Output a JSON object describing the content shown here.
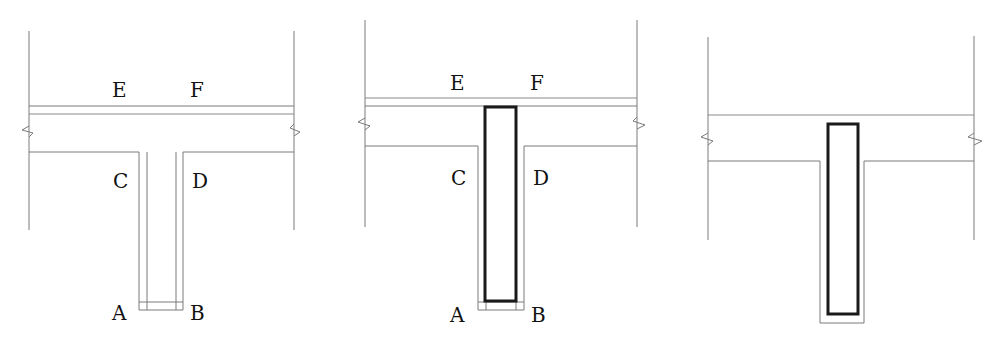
{
  "figure": {
    "panels": [
      {
        "id": "panel-1",
        "description": "T-beam section, original",
        "labels": {
          "E": "E",
          "F": "F",
          "C": "C",
          "D": "D",
          "A": "A",
          "B": "B"
        },
        "reinforcement": false
      },
      {
        "id": "panel-2",
        "description": "T-beam section with embedded web member",
        "labels": {
          "E": "E",
          "F": "F",
          "C": "C",
          "D": "D",
          "A": "A",
          "B": "B"
        },
        "reinforcement": true
      },
      {
        "id": "panel-3",
        "description": "T-beam section with embedded web member, unlabeled",
        "labels": {},
        "reinforcement": true
      }
    ],
    "colors": {
      "line": "#7a7a7a",
      "bold": "#1a1a1a",
      "background": "#ffffff"
    }
  }
}
